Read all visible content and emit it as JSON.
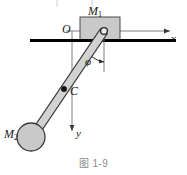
{
  "figure": {
    "caption": "图 1-9",
    "labels": {
      "block_mass": "M",
      "block_mass_sub": "1",
      "ball_mass": "M",
      "ball_mass_sub": "2",
      "origin": "O",
      "center_of_mass": "C",
      "x_axis": "x",
      "y_axis": "y",
      "angle": "φ"
    },
    "colors": {
      "stroke": "#1a1a1a",
      "block_fill": "#c9c9c9",
      "rod_fill": "#d2d2d2",
      "ball_fill": "#c9c9c9",
      "axis_line": "#6f6f6f",
      "surface_line": "#000000",
      "caption_text": "#8d8d8d"
    },
    "geometry": {
      "block": {
        "x": 80,
        "y": 17,
        "width": 40,
        "height": 24
      },
      "surface_line": {
        "x1": 30,
        "y1": 40,
        "x2": 175,
        "y2": 40,
        "width": 3
      },
      "x_axis": {
        "x1": 72,
        "y1": 31,
        "x2": 174,
        "y2": 31
      },
      "y_axis": {
        "x1": 72,
        "y1": 31,
        "x2": 72,
        "y2": 137
      },
      "pivot": {
        "cx": 104,
        "cy": 31,
        "r": 3.2
      },
      "rod": {
        "x1": 104,
        "y1": 31,
        "x2": 33,
        "y2": 136,
        "thickness": 8
      },
      "ball": {
        "cx": 31,
        "cy": 137,
        "r": 14
      },
      "point_c": {
        "cx": 64,
        "cy": 89,
        "r": 2.6
      },
      "angle_reference": {
        "x1": 104,
        "y1": 31,
        "x2": 104,
        "y2": 70
      },
      "angle_arc_degrees": 34
    }
  }
}
